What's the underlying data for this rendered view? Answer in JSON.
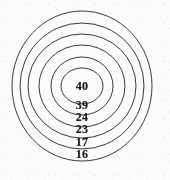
{
  "figure": {
    "name": "concentric-circles-diagram",
    "background_color": "#fbfbf9",
    "stroke_color": "#3a3a38",
    "label_color": "#1d1d1c"
  },
  "chart_data": {
    "type": "pie",
    "title": "",
    "subtitle": "",
    "xlabel": "",
    "ylabel": "",
    "grid": false,
    "legend_position": "none",
    "center": {
      "x": 82,
      "y": 86
    },
    "categories": [
      "40",
      "39",
      "24",
      "23",
      "17",
      "16"
    ],
    "values": [
      40,
      39,
      24,
      23,
      17,
      16
    ],
    "rings": [
      {
        "label": "40",
        "value": 40,
        "order": 1,
        "position": "innermost",
        "rx": 21,
        "ry": 18,
        "label_x": 82,
        "label_y": 86
      },
      {
        "label": "39",
        "value": 39,
        "order": 2,
        "position": "inner",
        "rx": 31,
        "ry": 29,
        "label_x": 82,
        "label_y": 105
      },
      {
        "label": "24",
        "value": 24,
        "order": 3,
        "position": "middle",
        "rx": 43,
        "ry": 41,
        "label_x": 82,
        "label_y": 117
      },
      {
        "label": "23",
        "value": 23,
        "order": 4,
        "position": "middle",
        "rx": 54,
        "ry": 52,
        "label_x": 82,
        "label_y": 129
      },
      {
        "label": "17",
        "value": 17,
        "order": 5,
        "position": "outer",
        "rx": 62,
        "ry": 63,
        "label_x": 82,
        "label_y": 142
      },
      {
        "label": "16",
        "value": 16,
        "order": 6,
        "position": "outermost",
        "rx": 70,
        "ry": 75,
        "label_x": 82,
        "label_y": 154
      }
    ]
  }
}
